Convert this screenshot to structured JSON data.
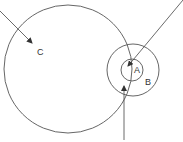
{
  "diagram": {
    "labels": {
      "a": "A",
      "b": "B",
      "c": "C"
    },
    "colors": {
      "stroke": "#555555",
      "text": "#333333",
      "background": "#ffffff"
    },
    "circles": [
      {
        "id": "C",
        "cx": 68,
        "cy": 69,
        "r": 64
      },
      {
        "id": "B",
        "cx": 133,
        "cy": 70,
        "r": 26
      },
      {
        "id": "A",
        "cx": 132,
        "cy": 70,
        "r": 11
      }
    ],
    "arrows": [
      {
        "from": [
          0,
          11
        ],
        "to": [
          32,
          43
        ],
        "target": "C"
      },
      {
        "from": [
          183,
          0
        ],
        "to": [
          128,
          66
        ],
        "target": "A"
      },
      {
        "from": [
          124,
          140
        ],
        "to": [
          124,
          86
        ],
        "target": "B"
      }
    ]
  }
}
